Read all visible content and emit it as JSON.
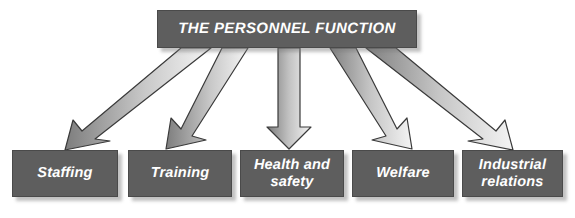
{
  "diagram": {
    "type": "hierarchy-fan-out",
    "title_node": {
      "label": "THE PERSONNEL FUNCTION",
      "shape": "rectangle",
      "fill_color": "#5e5e5e",
      "text_color": "#ffffff"
    },
    "connector": {
      "style": "block-arrow",
      "count": 5,
      "fill_gradient_from": "#7e7e7e",
      "fill_gradient_to": "#f2f2f2",
      "outline_color": "#3c3c3c",
      "direction": "downward"
    },
    "leaf_nodes": [
      {
        "id": "staffing",
        "label": "Staffing",
        "lines": [
          "Staffing"
        ]
      },
      {
        "id": "training",
        "label": "Training",
        "lines": [
          "Training"
        ]
      },
      {
        "id": "health-and-safety",
        "label": "Health and safety",
        "lines": [
          "Health and",
          "safety"
        ]
      },
      {
        "id": "welfare",
        "label": "Welfare",
        "lines": [
          "Welfare"
        ]
      },
      {
        "id": "industrial-relations",
        "label": "Industrial relations",
        "lines": [
          "Industrial",
          "relations"
        ]
      }
    ],
    "colors": {
      "box_fill": "#5e5e5e",
      "box_border": "#4a4a4a",
      "box_text": "#ffffff",
      "background": "#ffffff",
      "shadow": "#b4b4b4"
    }
  }
}
